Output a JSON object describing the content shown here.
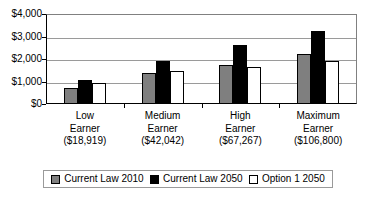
{
  "chart_data": {
    "type": "bar",
    "title": "",
    "subtitle": "",
    "xlabel": "",
    "ylabel": "",
    "ylim": [
      0,
      4000
    ],
    "ytick_values": [
      0,
      1000,
      2000,
      3000,
      4000
    ],
    "ytick_labels": [
      "$0",
      "$1,000",
      "$2,000",
      "$3,000",
      "$4,000"
    ],
    "grid": true,
    "legend_position": "bottom",
    "categories": [
      "Low Earner",
      "Medium Earner",
      "High Earner",
      "Maximum Earner"
    ],
    "category_lines": [
      [
        "Low",
        "Earner",
        "($18,919)"
      ],
      [
        "Medium",
        "Earner",
        "($42,042)"
      ],
      [
        "High",
        "Earner",
        "($67,267)"
      ],
      [
        "Maximum",
        "Earner",
        "($106,800)"
      ]
    ],
    "category_sublabels": [
      "($18,919)",
      "($42,042)",
      "($67,267)",
      "($106,800)"
    ],
    "series": [
      {
        "name": "Current Law 2010",
        "color": "#7f7f7f",
        "values": [
          700,
          1400,
          1720,
          2220
        ]
      },
      {
        "name": "Current Law 2050",
        "color": "#000000",
        "values": [
          1080,
          1910,
          2610,
          3260
        ]
      },
      {
        "name": "Option 1 2050",
        "color": "#ffffff",
        "values": [
          930,
          1460,
          1630,
          1910
        ]
      }
    ]
  },
  "legend": {
    "items": [
      {
        "label": "Current Law 2010"
      },
      {
        "label": "Current Law 2050"
      },
      {
        "label": "Option 1 2050"
      }
    ]
  }
}
